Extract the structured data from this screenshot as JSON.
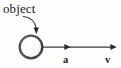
{
  "figure": {
    "type": "physics-vector-diagram",
    "width": 121,
    "height": 68,
    "background_color": "#fefefe",
    "ink_color": "#1a1a1a",
    "labels": {
      "object": "object",
      "acceleration": "a",
      "velocity": "v"
    },
    "ball": {
      "name": "object-ball",
      "center_x": 31,
      "center_y": 47,
      "radius": 11.5,
      "outline_color": "#4a4a4a",
      "fill_light": "#ffffff",
      "fill_shadow": "#8c8c8c"
    },
    "pointer": {
      "name": "object-callout-arrow",
      "from_x": 24,
      "from_y": 16,
      "to_x": 36,
      "to_y": 33
    },
    "vector_line": {
      "name": "motion-vector-line",
      "start_x": 43,
      "end_x": 116,
      "y": 47,
      "color": "#3a3a3a",
      "arrowheads": [
        {
          "label": "a",
          "x": 70
        },
        {
          "label": "v",
          "x": 116
        }
      ]
    }
  }
}
